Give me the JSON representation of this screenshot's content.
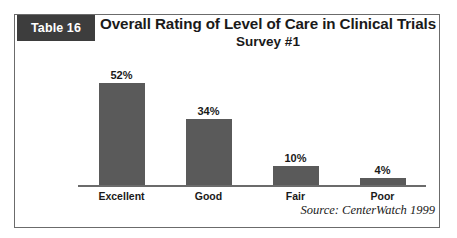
{
  "badge": {
    "label": "Table 16"
  },
  "header": {
    "title": "Overall Rating of Level of Care in Clinical Trials",
    "subtitle": "Survey #1"
  },
  "footer": {
    "source": "Source: CenterWatch 1999"
  },
  "colors": {
    "bar_fill": "#5a5a5a",
    "badge_background": "#3d3d3d",
    "badge_text": "#ffffff",
    "frame_border": "#6b6b6b",
    "axis_line": "#6b6b6b",
    "text": "#1a1a1a",
    "background": "#ffffff"
  },
  "chart_data": {
    "type": "bar",
    "title": "Overall Rating of Level of Care in Clinical Trials",
    "subtitle": "Survey #1",
    "categories": [
      "Excellent",
      "Good",
      "Fair",
      "Poor"
    ],
    "values": [
      52,
      34,
      10,
      4
    ],
    "value_labels": [
      "52%",
      "34%",
      "10%",
      "4%"
    ],
    "xlabel": "",
    "ylabel": "",
    "ylim": [
      0,
      58
    ],
    "grid": false,
    "legend": false,
    "orientation": "vertical",
    "units": "percent",
    "source": "Source: CenterWatch 1999"
  }
}
